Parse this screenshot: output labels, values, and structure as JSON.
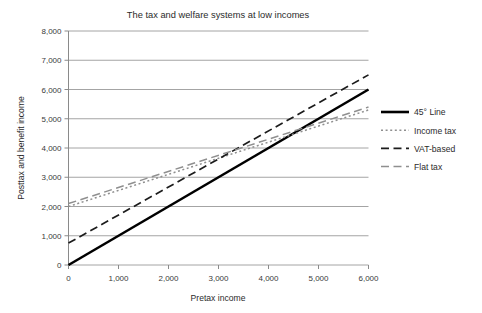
{
  "chart_data": {
    "type": "line",
    "title": "The tax and welfare systems at low incomes",
    "xlabel": "Pretax income",
    "ylabel": "Posttax and benefit income",
    "xlim": [
      0,
      6000
    ],
    "ylim": [
      0,
      8000
    ],
    "xticks": [
      "0",
      "1,000",
      "2,000",
      "3,000",
      "4,000",
      "5,000",
      "6,000"
    ],
    "xtick_values": [
      0,
      1000,
      2000,
      3000,
      4000,
      5000,
      6000
    ],
    "yticks": [
      "0",
      "1,000",
      "2,000",
      "3,000",
      "4,000",
      "5,000",
      "6,000",
      "7,000",
      "8,000"
    ],
    "ytick_values": [
      0,
      1000,
      2000,
      3000,
      4000,
      5000,
      6000,
      7000,
      8000
    ],
    "grid": "horizontal",
    "legend_position": "right",
    "x": [
      0,
      6000
    ],
    "series": [
      {
        "name": "45° Line",
        "values": [
          0,
          6000
        ],
        "color": "#000000",
        "style": "solid",
        "width": 2.6,
        "dash": ""
      },
      {
        "name": "Income tax",
        "values": [
          2000,
          5300
        ],
        "color": "#8f8f8f",
        "style": "dotted",
        "width": 1.5,
        "dash": "2,2.6"
      },
      {
        "name": "VAT-based",
        "values": [
          750,
          6500
        ],
        "color": "#1c1c1c",
        "style": "dashed",
        "width": 1.7,
        "dash": "8,4.5"
      },
      {
        "name": "Flat tax",
        "values": [
          2100,
          5400
        ],
        "color": "#8f8f8f",
        "style": "dashed",
        "width": 1.5,
        "dash": "8,4.5"
      }
    ]
  },
  "legend": {
    "items": [
      {
        "label": "45° Line"
      },
      {
        "label": "Income tax"
      },
      {
        "label": "VAT-based"
      },
      {
        "label": "Flat tax"
      }
    ]
  },
  "colors": {
    "background": "#ffffff",
    "grid": "#9a9a9a",
    "axis": "#8a8a8a",
    "text": "#2b2b2b",
    "series_black": "#000000",
    "series_gray": "#8f8f8f"
  }
}
